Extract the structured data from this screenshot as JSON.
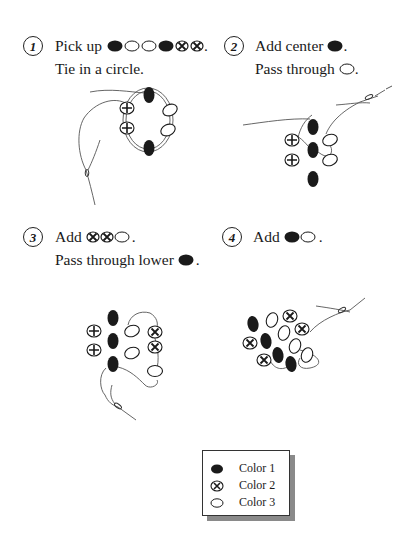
{
  "colors": {
    "color1": "#1a1a1a",
    "color2_outline": "#1a1a1a",
    "color3_fill": "#ffffff",
    "thread": "#555555"
  },
  "steps": [
    {
      "number": "1",
      "line1": "Pick up",
      "line1_beads": [
        "color1",
        "color3",
        "color3",
        "color1",
        "color2",
        "color2"
      ],
      "line1_end": ".",
      "line2": "Tie in a circle."
    },
    {
      "number": "2",
      "line1": "Add center",
      "line1_beads": [
        "color1"
      ],
      "line1_end": ".",
      "line2": "Pass through",
      "line2_beads": [
        "color3"
      ],
      "line2_end": "."
    },
    {
      "number": "3",
      "line1": "Add",
      "line1_beads": [
        "color2",
        "color2",
        "color3"
      ],
      "line1_end": ".",
      "line2": "Pass through lower",
      "line2_beads": [
        "color1"
      ],
      "line2_end": "."
    },
    {
      "number": "4",
      "line1": "Add",
      "line1_beads": [
        "color1",
        "color3"
      ],
      "line1_end": "."
    }
  ],
  "legend": {
    "items": [
      {
        "bead": "color1",
        "label": "Color 1"
      },
      {
        "bead": "color2",
        "label": "Color 2"
      },
      {
        "bead": "color3",
        "label": "Color 3"
      }
    ]
  }
}
